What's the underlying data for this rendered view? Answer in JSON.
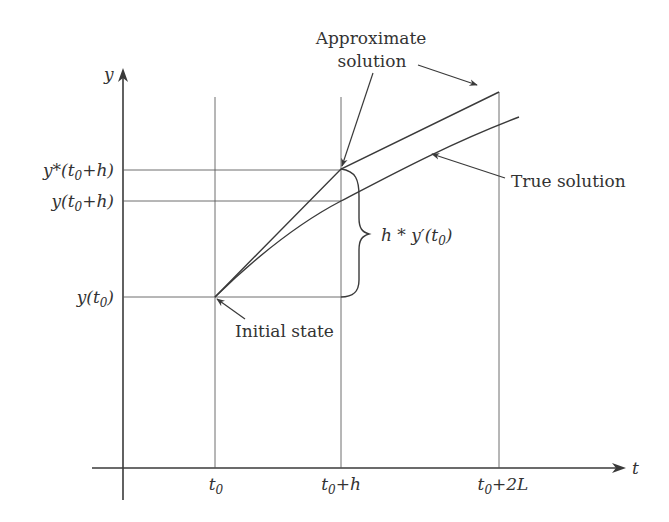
{
  "diagram": {
    "type": "euler-method-illustration",
    "axes": {
      "x_label": "t",
      "y_label": "y"
    },
    "x_ticks": [
      {
        "base": "t",
        "sub": "0",
        "rest": ""
      },
      {
        "base": "t",
        "sub": "0",
        "rest": "+h"
      },
      {
        "base": "t",
        "sub": "0",
        "rest": "+2L"
      }
    ],
    "y_ticks": [
      {
        "pre": "y*(t",
        "sub": "0",
        "rest": "+h)"
      },
      {
        "pre": "y(t",
        "sub": "0",
        "rest": "+h)"
      },
      {
        "pre": "y(t",
        "sub": "0",
        "rest": ")"
      }
    ],
    "annotations": {
      "approx_line1": "Approximate",
      "approx_line2": "solution",
      "true_solution": "True solution",
      "initial_state": "Initial state",
      "step": {
        "pre": "h * y′(t",
        "sub": "0",
        "rest": ")"
      }
    },
    "colors": {
      "ink": "#3a3a3a",
      "background": "#ffffff"
    }
  }
}
